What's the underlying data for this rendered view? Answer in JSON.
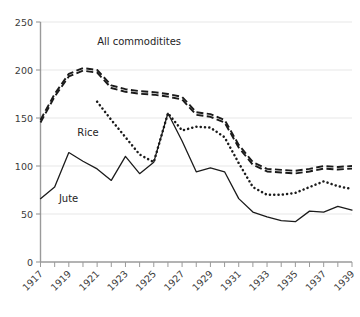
{
  "chart_data": {
    "type": "line",
    "title": "",
    "subtitle": "",
    "xlabel": "",
    "ylabel": "",
    "xlim": [
      1917,
      1939
    ],
    "ylim": [
      0,
      250
    ],
    "grid": true,
    "legend_position": "inline-annotations",
    "y_ticks": [
      0,
      50,
      100,
      150,
      200,
      250
    ],
    "y_tick_labels": [
      "0",
      "50",
      "100",
      "150",
      "200",
      "250"
    ],
    "x_ticks": [
      1917,
      1919,
      1921,
      1923,
      1925,
      1927,
      1929,
      1931,
      1933,
      1935,
      1937,
      1939
    ],
    "x_tick_labels": [
      "1917",
      "1919",
      "1921",
      "1923",
      "1925",
      "1927",
      "1929",
      "1931",
      "1933",
      "1935",
      "1937",
      "1939"
    ],
    "x_minor_ticks": [
      1918,
      1920,
      1922,
      1924,
      1926,
      1928,
      1930,
      1932,
      1934,
      1936,
      1938
    ],
    "x": [
      1917,
      1918,
      1919,
      1920,
      1921,
      1922,
      1923,
      1924,
      1925,
      1926,
      1927,
      1928,
      1929,
      1930,
      1931,
      1932,
      1933,
      1934,
      1935,
      1936,
      1937,
      1938,
      1939
    ],
    "series": [
      {
        "name": "All commoditites",
        "style": "dashed",
        "label": "All commoditites",
        "label_x": 1921.0,
        "label_y": 226,
        "x": [
          1917,
          1918,
          1919,
          1920,
          1921,
          1922,
          1923,
          1924,
          1925,
          1926,
          1927,
          1928,
          1929,
          1930,
          1931,
          1932,
          1933,
          1934,
          1935,
          1936,
          1937,
          1938,
          1939
        ],
        "values": [
          148,
          175,
          196,
          202,
          200,
          184,
          180,
          178,
          177,
          175,
          172,
          156,
          154,
          148,
          122,
          104,
          97,
          96,
          95,
          97,
          100,
          99,
          100
        ]
      },
      {
        "name": "Rice",
        "style": "dotted",
        "label": "Rice",
        "label_x": 1919.6,
        "label_y": 131,
        "x": [
          1921,
          1922,
          1923,
          1924,
          1925,
          1926,
          1927,
          1928,
          1929,
          1930,
          1931,
          1932,
          1933,
          1934,
          1935,
          1936,
          1937,
          1938,
          1939
        ],
        "values": [
          167,
          148,
          130,
          112,
          104,
          155,
          137,
          141,
          140,
          130,
          103,
          78,
          70,
          70,
          72,
          78,
          84,
          79,
          76
        ]
      },
      {
        "name": "Jute",
        "style": "solid",
        "label": "Jute",
        "label_x": 1918.3,
        "label_y": 63,
        "x": [
          1917,
          1918,
          1919,
          1920,
          1921,
          1922,
          1923,
          1924,
          1925,
          1926,
          1927,
          1928,
          1929,
          1930,
          1931,
          1932,
          1933,
          1934,
          1935,
          1936,
          1937,
          1938,
          1939
        ],
        "values": [
          66,
          78,
          114,
          105,
          97,
          85,
          110,
          92,
          104,
          155,
          126,
          94,
          98,
          94,
          66,
          52,
          47,
          43,
          42,
          53,
          52,
          58,
          54
        ]
      }
    ]
  },
  "axes": {
    "y_axis_name": "index-value-axis",
    "x_axis_name": "year-axis"
  }
}
